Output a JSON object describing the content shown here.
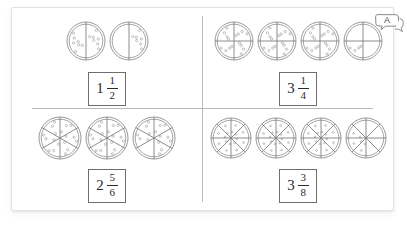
{
  "worksheet": {
    "callout": {
      "label": "A",
      "icon": "speech-bubble-icon"
    },
    "quadrants": [
      {
        "id": "top-left",
        "denominator": 2,
        "whole_pizzas": 1,
        "partial_filled_slices": 1,
        "pizzas": [
          {
            "slices": 2,
            "topped": [
              0,
              1
            ]
          },
          {
            "slices": 2,
            "topped": [
              0
            ]
          }
        ],
        "answer": {
          "whole": "1",
          "numerator": "1",
          "denominator": "2",
          "text": "1 1/2"
        }
      },
      {
        "id": "top-right",
        "denominator": 4,
        "whole_pizzas": 3,
        "partial_filled_slices": 1,
        "pizzas": [
          {
            "slices": 4,
            "topped": [
              0,
              1,
              2,
              3
            ]
          },
          {
            "slices": 4,
            "topped": [
              0,
              1,
              2,
              3
            ]
          },
          {
            "slices": 4,
            "topped": [
              0,
              1,
              2,
              3
            ]
          },
          {
            "slices": 4,
            "topped": [
              2
            ]
          }
        ],
        "answer": {
          "whole": "3",
          "numerator": "1",
          "denominator": "4",
          "text": "3 1/4"
        }
      },
      {
        "id": "bottom-left",
        "denominator": 6,
        "whole_pizzas": 2,
        "partial_filled_slices": 5,
        "pizzas": [
          {
            "slices": 6,
            "topped": [
              0,
              1,
              2,
              3,
              4,
              5
            ]
          },
          {
            "slices": 6,
            "topped": [
              0,
              1,
              2,
              3,
              4,
              5
            ]
          },
          {
            "slices": 6,
            "topped": [
              0,
              1,
              2,
              4,
              5
            ]
          }
        ],
        "answer": {
          "whole": "2",
          "numerator": "5",
          "denominator": "6",
          "text": "2 5/6"
        }
      },
      {
        "id": "bottom-right",
        "denominator": 8,
        "whole_pizzas": 3,
        "partial_filled_slices": 3,
        "pizzas": [
          {
            "slices": 8,
            "topped": [
              0,
              1,
              2,
              3,
              4,
              5,
              6,
              7
            ]
          },
          {
            "slices": 8,
            "topped": [
              0,
              1,
              2,
              3,
              4,
              5,
              6,
              7
            ]
          },
          {
            "slices": 8,
            "topped": [
              0,
              1,
              2,
              3,
              4,
              5,
              6,
              7
            ]
          },
          {
            "slices": 8,
            "topped": [
              4,
              5,
              6
            ]
          }
        ],
        "answer": {
          "whole": "3",
          "numerator": "3",
          "denominator": "8",
          "text": "3 3/8"
        }
      }
    ]
  },
  "colors": {
    "line": "#7a7a7a",
    "divider": "#b9b9b9",
    "crust": "#8d8d8d",
    "topping": "#9a9a9a",
    "text": "#2b2b2b",
    "box_border": "#6e6e6e",
    "card_border": "#e3e3e3"
  }
}
